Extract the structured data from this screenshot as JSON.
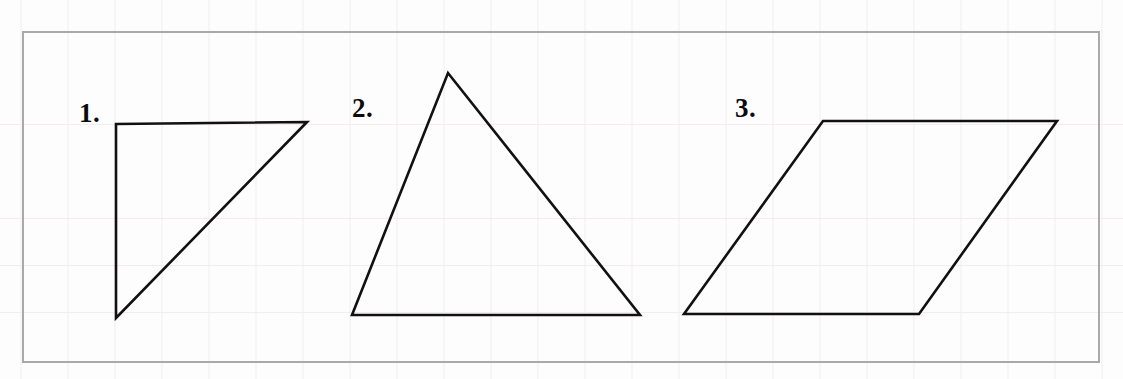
{
  "page": {
    "width": 1123,
    "height": 379,
    "background_color": "#fdfdfd",
    "grid": {
      "visible": true,
      "cell_size": 47,
      "color": "#f2ecec"
    },
    "border_box": {
      "x": 22,
      "y": 31,
      "width": 1078,
      "height": 332,
      "border_color": "#a9a9a9",
      "border_width": 2
    },
    "stroke_color": "#111111",
    "stroke_width": 2.6
  },
  "figures": [
    {
      "index": 1,
      "label": "1.",
      "label_x": 79,
      "label_y": 100,
      "shape": "right-triangle",
      "closed": true,
      "points": [
        [
          116,
          124
        ],
        [
          307,
          122
        ],
        [
          116,
          318
        ]
      ]
    },
    {
      "index": 2,
      "label": "2.",
      "label_x": 352,
      "label_y": 95,
      "shape": "scalene-triangle",
      "closed": true,
      "points": [
        [
          448,
          73
        ],
        [
          640,
          315
        ],
        [
          352,
          315
        ]
      ]
    },
    {
      "index": 3,
      "label": "3.",
      "label_x": 735,
      "label_y": 95,
      "shape": "parallelogram",
      "closed": true,
      "points": [
        [
          823,
          121
        ],
        [
          1057,
          121
        ],
        [
          919,
          314
        ],
        [
          684,
          314
        ]
      ]
    }
  ]
}
